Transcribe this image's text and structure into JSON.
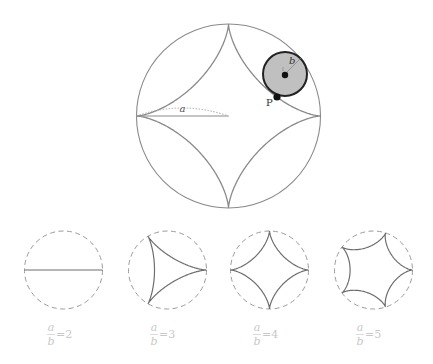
{
  "main_figure": {
    "fixed_circle": {
      "cx": 228.5,
      "cy": 116,
      "r": 92
    },
    "rolling_circle": {
      "cx": 285,
      "cy": 74,
      "r": 22,
      "fill": "#c0c0c0"
    },
    "ratio": 4,
    "labels": {
      "a": "a",
      "b": "b",
      "P": "P"
    },
    "colors": {
      "curve": "#8a8a8a",
      "circle": "#8a8a8a",
      "rolling_stroke": "#222222",
      "dot": "#111111"
    }
  },
  "examples": [
    {
      "cx": 63.5,
      "cy": 270,
      "r": 39,
      "n": 2,
      "label_num": "a",
      "label_den": "b",
      "label_eq": "=2"
    },
    {
      "cx": 167.5,
      "cy": 270,
      "r": 39,
      "n": 3,
      "label_num": "a",
      "label_den": "b",
      "label_eq": "=3"
    },
    {
      "cx": 269.5,
      "cy": 270,
      "r": 39,
      "n": 4,
      "label_num": "a",
      "label_den": "b",
      "label_eq": "=4"
    },
    {
      "cx": 373.5,
      "cy": 270,
      "r": 39,
      "n": 5,
      "label_num": "a",
      "label_den": "b",
      "label_eq": "=5"
    }
  ],
  "colors": {
    "dashed": "#9a9a9a",
    "curve": "#6e6e6e",
    "label": "#c8c8c8"
  }
}
